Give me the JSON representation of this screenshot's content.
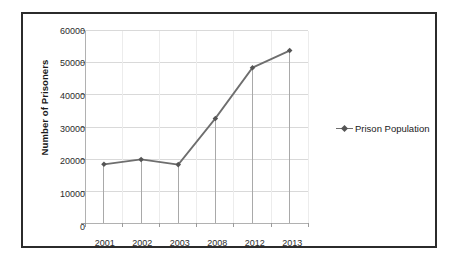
{
  "chart_data": {
    "type": "line",
    "title": "",
    "subtitle": "",
    "xlabel": "",
    "ylabel": "Number of Prisoners",
    "categories": [
      "2001",
      "2002",
      "2003",
      "2008",
      "2012",
      "2013"
    ],
    "series": [
      {
        "name": "Prison Population",
        "values": [
          18400,
          19900,
          18300,
          32700,
          48500,
          53800
        ],
        "color": "#6e6e6e",
        "marker": "diamond",
        "marker_color": "#555555"
      }
    ],
    "ylim": [
      0,
      60000
    ],
    "yticks": [
      0,
      10000,
      20000,
      30000,
      40000,
      50000,
      60000
    ],
    "ytick_labels": [
      "0",
      "10000",
      "20000",
      "30000",
      "40000",
      "50000",
      "60000"
    ],
    "grid": {
      "horizontal": true,
      "vertical_category_separators": true,
      "droplines": true,
      "color": "#d9d9d9"
    },
    "legend": {
      "position": "right",
      "entries": [
        {
          "label": "Prison Population",
          "marker": "line-with-diamond-marker"
        }
      ]
    },
    "axis": {
      "line_color": "#b0b0b0",
      "tick_color": "#9a9a9a"
    },
    "frame": {
      "border_color": "#2b2b2b",
      "background": "#ffffff"
    }
  }
}
